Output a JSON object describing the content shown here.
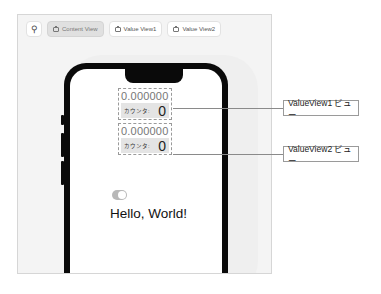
{
  "toolbar": {
    "pin_icon": "pin-icon",
    "buttons": [
      {
        "label": "Content View",
        "icon": "preview-icon",
        "active": true
      },
      {
        "label": "Value View1",
        "icon": "preview-icon",
        "active": false
      },
      {
        "label": "Value View2",
        "icon": "preview-icon",
        "active": false
      }
    ]
  },
  "preview": {
    "value_views": [
      {
        "number": "0.000000",
        "counter_label": "カウンタ:",
        "count": "0"
      },
      {
        "number": "0.000000",
        "counter_label": "カウンタ:",
        "count": "0"
      }
    ],
    "toggle_on": true,
    "hello_text": "Hello, World!"
  },
  "callouts": [
    {
      "label": "ValueView1 ビュー"
    },
    {
      "label": "ValueView2 ビュー"
    }
  ],
  "colors": {
    "canvas_bg": "#f4f4f4",
    "phone_frame": "#0a0a0a",
    "toggle": "#b8b8b8",
    "counter_shade": "#e4e4e4"
  }
}
